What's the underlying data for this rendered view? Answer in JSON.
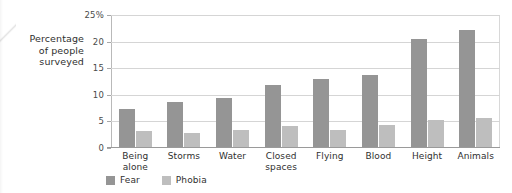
{
  "chart_data": {
    "type": "bar",
    "title": "",
    "subtitle": "",
    "xlabel": "",
    "ylabel": "Percentage of people surveyed",
    "ylabel_lines": [
      "Percentage",
      "of people",
      "surveyed"
    ],
    "categories": [
      "Being alone",
      "Storms",
      "Water",
      "Closed spaces",
      "Flying",
      "Blood",
      "Height",
      "Animals"
    ],
    "category_lines": [
      [
        "Being",
        "alone"
      ],
      [
        "Storms"
      ],
      [
        "Water"
      ],
      [
        "Closed",
        "spaces"
      ],
      [
        "Flying"
      ],
      [
        "Blood"
      ],
      [
        "Height"
      ],
      [
        "Animals"
      ]
    ],
    "series": [
      {
        "name": "Fear",
        "color": "#959595",
        "values": [
          7.3,
          8.7,
          9.4,
          11.8,
          13.0,
          13.8,
          20.4,
          22.1
        ]
      },
      {
        "name": "Phobia",
        "color": "#bebebe",
        "values": [
          3.2,
          2.9,
          3.4,
          4.2,
          3.4,
          4.3,
          5.2,
          5.7
        ]
      }
    ],
    "ylim": [
      0,
      25
    ],
    "yticks": [
      0,
      5,
      10,
      15,
      20,
      25
    ],
    "ytick_labels": [
      "0",
      "5",
      "10",
      "15",
      "20",
      "25%"
    ],
    "grid": true,
    "legend_position": "bottom-left",
    "legend": [
      "Fear",
      "Phobia"
    ]
  }
}
